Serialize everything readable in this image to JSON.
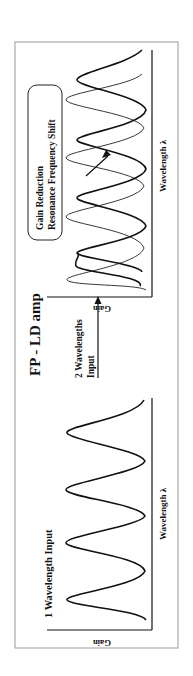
{
  "diagram": {
    "title": "FP - LD amp",
    "rotation_deg": -90,
    "left_panel": {
      "heading": "1 Wavelength Input",
      "y_axis_label": "Gain",
      "x_axis_label": "Wavelength λ",
      "curves": [
        {
          "name": "single-wavelength gain",
          "style": "thick",
          "peak_positions": [
            76,
            133,
            186,
            243
          ]
        }
      ]
    },
    "transition": {
      "label_line1": "2 Wavelengths",
      "label_line2": "Input"
    },
    "right_panel": {
      "y_axis_label": "Gain",
      "x_axis_label": "Wavelength λ",
      "annotation_line1": "Gain Reduction",
      "annotation_line2": "Resonance Frequency Shift",
      "curves": [
        {
          "name": "shifted reduced gain",
          "style": "thick",
          "peak_positions": [
            423,
            478,
            536,
            596
          ]
        },
        {
          "name": "original gain",
          "style": "thin",
          "peak_positions": [
            396,
            459,
            518,
            576
          ]
        }
      ]
    },
    "colors": {
      "ink": "#111111",
      "frame": "#9a9a9a",
      "background": "#ffffff"
    }
  }
}
